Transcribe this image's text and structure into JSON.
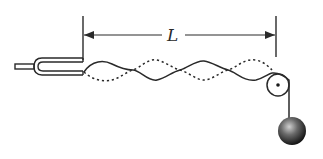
{
  "diagram": {
    "length_label": "L",
    "components": [
      {
        "name": "tuning-fork",
        "description": "Vibrating source at left end"
      },
      {
        "name": "string-wave",
        "description": "Standing wave, solid and dashed envelopes, 4 loops"
      },
      {
        "name": "pulley",
        "description": "Pulley at right end"
      },
      {
        "name": "hanging-mass",
        "description": "Spherical mass hanging from string"
      },
      {
        "name": "length-dimension",
        "description": "Double-headed arrow marking length L"
      }
    ],
    "loops": 4,
    "colors": {
      "line": "#2a2a2a",
      "background": "#ffffff",
      "ball_light": "#bdbdbd",
      "ball_dark": "#1a1a1a"
    }
  }
}
